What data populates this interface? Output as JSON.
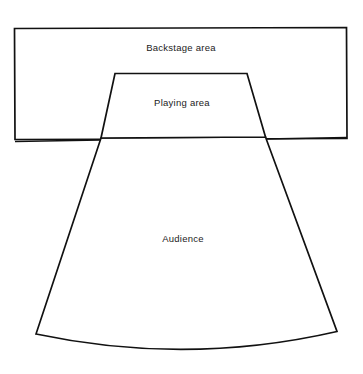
{
  "diagram": {
    "type": "theatre-layout-plan",
    "canvas": {
      "width": 363,
      "height": 374
    },
    "background_color": "#ffffff",
    "line_color": "#111111",
    "text_color": "#1b1b1b",
    "areas": [
      {
        "key": "backstage",
        "label": "Backstage area",
        "shape": "rectangle",
        "label_position": {
          "x": 181,
          "y": 47
        }
      },
      {
        "key": "playing",
        "label": "Playing area",
        "shape": "trapezoid",
        "label_position": {
          "x": 182,
          "y": 102
        }
      },
      {
        "key": "audience",
        "label": "Audience",
        "shape": "fan-with-curved-base",
        "label_position": {
          "x": 183,
          "y": 238
        }
      }
    ],
    "geometry": {
      "backstage_rect": "M14.5,28.5 L346.5,27.5 L347,138.5 L15,139.5 Z",
      "playing_trapezoid": "M115,73.5 L247,73.5 L265.5,137 L101,138 Z",
      "audience_fan": "M101,138 L265.5,137 L337,331.5 Q186.5,366 36,334 Z",
      "stage_front_left": "M15,141.5 L101,140",
      "stage_front_right": "M266,139 L347,137.5",
      "stroke_width_outline": 1.7,
      "stroke_width_front": 1.6
    }
  }
}
